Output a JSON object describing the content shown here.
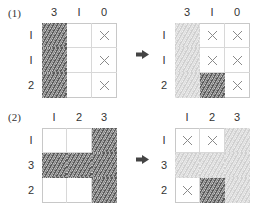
{
  "problems": [
    {
      "label": "(1)",
      "col_clues": [
        "3",
        "I",
        "0"
      ],
      "row_clues": [
        "I",
        "I",
        "2"
      ],
      "before": [
        [
          "dark",
          "empty",
          "x"
        ],
        [
          "dark",
          "empty",
          "x"
        ],
        [
          "dark",
          "empty",
          "x"
        ]
      ],
      "after": [
        [
          "light",
          "x",
          "x"
        ],
        [
          "light",
          "x",
          "x"
        ],
        [
          "light",
          "dark",
          "x"
        ]
      ]
    },
    {
      "label": "(2)",
      "col_clues": [
        "I",
        "2",
        "3"
      ],
      "row_clues": [
        "I",
        "3",
        "2"
      ],
      "before": [
        [
          "empty",
          "empty",
          "dark"
        ],
        [
          "dark",
          "dark",
          "dark"
        ],
        [
          "empty",
          "empty",
          "dark"
        ]
      ],
      "after": [
        [
          "x",
          "x",
          "light"
        ],
        [
          "light",
          "light",
          "light"
        ],
        [
          "x",
          "dark",
          "light"
        ]
      ]
    }
  ],
  "arrow_icon": "right-arrow"
}
